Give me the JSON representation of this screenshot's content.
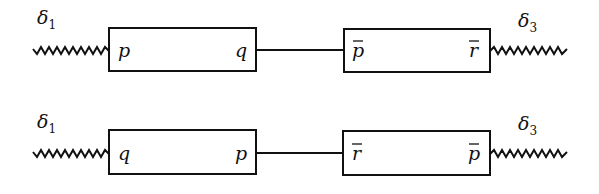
{
  "diagram": {
    "rows": [
      {
        "left_spring": {
          "label": "δ",
          "subscript": "1"
        },
        "box_a": {
          "left_label": "p",
          "right_label": "q",
          "left_bar": false,
          "right_bar": false
        },
        "box_b": {
          "left_label": "p",
          "right_label": "r",
          "left_bar": true,
          "right_bar": true
        },
        "right_spring": {
          "label": "δ",
          "subscript": "3"
        }
      },
      {
        "left_spring": {
          "label": "δ",
          "subscript": "1"
        },
        "box_a": {
          "left_label": "q",
          "right_label": "p",
          "left_bar": false,
          "right_bar": false
        },
        "box_b": {
          "left_label": "r",
          "right_label": "p",
          "left_bar": true,
          "right_bar": true
        },
        "right_spring": {
          "label": "δ",
          "subscript": "3"
        }
      }
    ]
  }
}
